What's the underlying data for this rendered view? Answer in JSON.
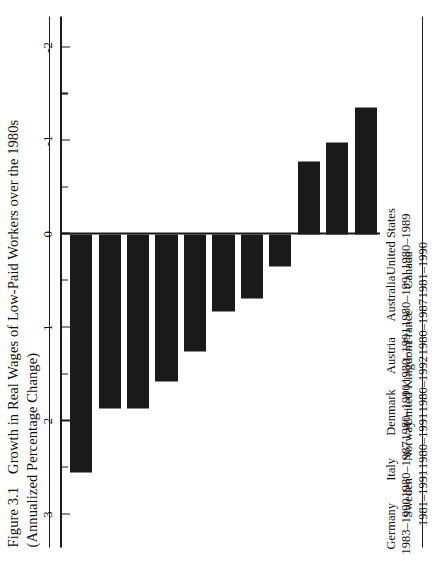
{
  "figure": {
    "number": "Figure 3.1",
    "title": "Growth in Real Wages of Low-Paid Workers over the 1980s",
    "subtitle": "(Annualized Percentage Change)"
  },
  "chart_data": {
    "type": "bar",
    "orientation": "vertical-bars-drawn-downward",
    "title": "Growth in Real Wages of Low-Paid Workers over the 1980s",
    "subtitle": "(Annualized Percentage Change)",
    "xlabel": "",
    "ylabel": "Annualized Percentage Change",
    "ylim": [
      -2,
      3
    ],
    "y_tick_labels": [
      "3",
      "2",
      "1",
      "0",
      "-1",
      "-2"
    ],
    "y_ticks": [
      3,
      2,
      1,
      0,
      -1,
      -2
    ],
    "y_minor_ticks": [
      2.5,
      1.5,
      0.5,
      -0.5,
      -1.5
    ],
    "grid": false,
    "legend": "none",
    "bar_color": "#1a1a1a",
    "categories": [
      "Germany",
      "Sweden",
      "Italy",
      "Norway",
      "Denmark",
      "United Kingdom",
      "Austria",
      "France",
      "Australia",
      "Canada",
      "United States"
    ],
    "periods": [
      "1983–1990",
      "1981–1991",
      "1980–1987",
      "1980–1991",
      "1980–1990",
      "1980–1992",
      "1980–1991",
      "1980–1987",
      "1980–1991",
      "1981–1990",
      "1980–1989"
    ],
    "values": [
      2.55,
      1.87,
      1.87,
      1.58,
      1.25,
      0.83,
      0.69,
      0.35,
      -0.78,
      -0.98,
      -1.36
    ],
    "bars": [
      {
        "label": "Germany",
        "period": "1983–1990",
        "value": 2.55
      },
      {
        "label": "Sweden",
        "period": "1981–1991",
        "value": 1.87
      },
      {
        "label": "Italy",
        "period": "1980–1987",
        "value": 1.87
      },
      {
        "label": "Norway",
        "period": "1980–1991",
        "value": 1.58
      },
      {
        "label": "Denmark",
        "period": "1980–1990",
        "value": 1.25
      },
      {
        "label": "United Kingdom",
        "period": "1980–1992",
        "value": 0.83
      },
      {
        "label": "Austria",
        "period": "1980–1991",
        "value": 0.69
      },
      {
        "label": "France",
        "period": "1980–1987",
        "value": 0.35
      },
      {
        "label": "Australia",
        "period": "1980–1991",
        "value": -0.78
      },
      {
        "label": "Canada",
        "period": "1981–1990",
        "value": -0.98
      },
      {
        "label": "United States",
        "period": "1980–1989",
        "value": -1.36
      }
    ]
  }
}
